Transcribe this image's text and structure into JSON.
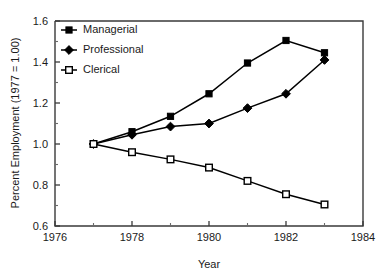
{
  "chart_data": {
    "type": "line",
    "title": "",
    "xlabel": "Year",
    "ylabel": "Percent Employment (1977 = 1.00)",
    "x": [
      1977,
      1978,
      1979,
      1980,
      1981,
      1982,
      1983
    ],
    "xlim": [
      1976,
      1984
    ],
    "ylim": [
      0.6,
      1.6
    ],
    "xticks": [
      1976,
      1978,
      1980,
      1982,
      1984
    ],
    "xticklabels": [
      "1976",
      "1978",
      "1980",
      "1982",
      "1984"
    ],
    "xminorticks": [
      1977,
      1979,
      1981,
      1983
    ],
    "yticks": [
      0.6,
      0.8,
      1.0,
      1.2,
      1.4,
      1.6
    ],
    "yticklabels": [
      "0.6",
      "0.8",
      "1.0",
      "1.2",
      "1.4",
      "1.6"
    ],
    "yminorticks": [
      0.7,
      0.9,
      1.1,
      1.3,
      1.5
    ],
    "grid": false,
    "legend_position": "upper left",
    "series": [
      {
        "name": "Managerial",
        "marker": "filled-square",
        "values": [
          1.0,
          1.06,
          1.135,
          1.245,
          1.395,
          1.505,
          1.445
        ]
      },
      {
        "name": "Professional",
        "marker": "filled-diamond",
        "values": [
          1.0,
          1.045,
          1.085,
          1.1,
          1.175,
          1.245,
          1.41
        ]
      },
      {
        "name": "Clerical",
        "marker": "open-square",
        "values": [
          1.0,
          0.96,
          0.925,
          0.885,
          0.82,
          0.755,
          0.705
        ]
      }
    ],
    "colors": {
      "line": "#000000",
      "marker_fill": "#000000",
      "marker_open_fill": "#ffffff",
      "axis": "#3a3a3a",
      "background": "#ffffff"
    }
  },
  "legend": {
    "items": [
      {
        "label": "Managerial"
      },
      {
        "label": "Professional"
      },
      {
        "label": "Clerical"
      }
    ]
  },
  "axes": {
    "x_title": "Year",
    "y_title": "Percent Employment (1977 = 1.00)"
  }
}
